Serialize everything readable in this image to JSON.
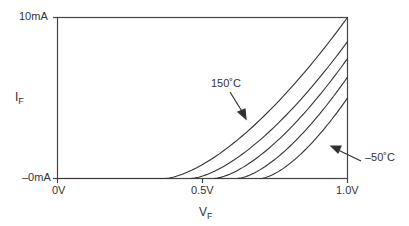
{
  "chart_data": {
    "type": "line",
    "title": "",
    "xlabel": "V",
    "xlabel_sub": "F",
    "ylabel": "I",
    "ylabel_sub": "F",
    "xlim": [
      0,
      1.0
    ],
    "ylim": [
      0,
      10
    ],
    "x_ticks": [
      "0V",
      "0.5V",
      "1.0V"
    ],
    "y_ticks": [
      "–0mA",
      "10mA"
    ],
    "grid": false,
    "series": [
      {
        "name": "150°C",
        "turn_on_v": 0.37,
        "x": [
          0.37,
          0.5,
          0.6,
          0.7,
          0.8,
          0.9,
          1.0
        ],
        "values": [
          0,
          0.9,
          2.2,
          3.8,
          5.6,
          7.7,
          10.0
        ]
      },
      {
        "name": "100°C",
        "turn_on_v": 0.46,
        "x": [
          0.46,
          0.6,
          0.7,
          0.8,
          0.9,
          1.0
        ],
        "values": [
          0,
          1.2,
          2.6,
          4.3,
          6.3,
          8.5
        ]
      },
      {
        "name": "50°C",
        "turn_on_v": 0.54,
        "x": [
          0.54,
          0.6,
          0.7,
          0.8,
          0.9,
          1.0
        ],
        "values": [
          0,
          0.4,
          1.6,
          3.2,
          5.2,
          7.45
        ]
      },
      {
        "name": "0°C",
        "turn_on_v": 0.62,
        "x": [
          0.62,
          0.7,
          0.8,
          0.9,
          1.0
        ],
        "values": [
          0,
          0.7,
          2.2,
          4.1,
          6.3
        ]
      },
      {
        "name": "–50°C",
        "turn_on_v": 0.7,
        "x": [
          0.7,
          0.8,
          0.9,
          1.0
        ],
        "values": [
          0,
          1.1,
          2.9,
          5.0
        ]
      }
    ],
    "annotations": [
      {
        "text": "150˚C",
        "points_to": "150°C"
      },
      {
        "text": "–50˚C",
        "points_to": "–50°C"
      }
    ]
  },
  "labels": {
    "y_top": "10mA",
    "y_bottom": "–0mA",
    "x_left": "0V",
    "x_mid": "0.5V",
    "x_right": "1.0V",
    "y_axis": "I",
    "y_axis_sub": "F",
    "x_axis": "V",
    "x_axis_sub": "F",
    "annot_hot": "150˚C",
    "annot_cold": "–50˚C"
  }
}
